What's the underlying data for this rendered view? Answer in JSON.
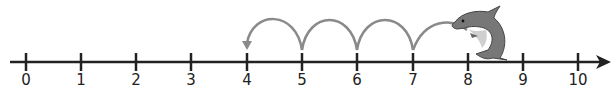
{
  "number_line": {
    "min": 0,
    "max": 10,
    "labels": [
      "0",
      "1",
      "2",
      "3",
      "4",
      "5",
      "6",
      "7",
      "8",
      "9",
      "10"
    ],
    "tick_x": [
      26,
      81,
      136,
      191,
      247,
      302,
      357,
      413,
      468,
      523,
      578
    ],
    "axis_color": "#222222"
  },
  "jumps": {
    "start": 8,
    "end": 4,
    "count": 4,
    "direction": "backward",
    "color": "#8a8a8a"
  },
  "character": {
    "icon": "dolphin-icon",
    "position": 8,
    "color": "#777777"
  }
}
